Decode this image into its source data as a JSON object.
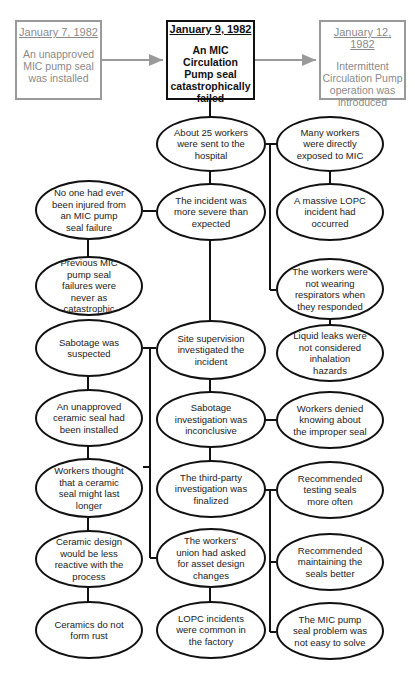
{
  "top_boxes": {
    "left": {
      "date": "January 7, 1982",
      "text": "An unapproved MIC pump seal was installed"
    },
    "center": {
      "date": "January 9, 1982",
      "text": "An MIC Circulation Pump seal catastrophically failed"
    },
    "right": {
      "date": "January 12, 1982",
      "text": "Intermittent Circulation Pump operation was introduced"
    }
  },
  "nodes": {
    "hospital": "About 25 workers were sent to the hospital",
    "exposed": "Many workers were directly exposed to MIC",
    "more_severe": "The incident was more severe than expected",
    "no_one_injured": "No one had ever been injured from an MIC pump seal failure",
    "massive_lopc": "A massive LOPC incident had occurred",
    "previous_failures": "Previous MIC pump seal failures were never as catastrophic",
    "no_respirators": "The workers were not wearing respirators when they responded",
    "sabotage_suspected": "Sabotage was suspected",
    "site_supervision": "Site supervision investigated the incident",
    "liquid_leaks": "Liquid leaks were not considered inhalation hazards",
    "ceramic_installed": "An unapproved ceramic seal had been installed",
    "sabotage_inconclusive": "Sabotage investigation was inconclusive",
    "workers_denied": "Workers denied knowing about the improper seal",
    "ceramic_longer": "Workers thought that a ceramic seal might last longer",
    "third_party": "The third-party investigation was finalized",
    "testing_seals": "Recommended testing seals more often",
    "ceramic_reactive": "Ceramic design would be less reactive with the process",
    "union_asked": "The workers' union had asked for asset design changes",
    "maintaining_seals": "Recommended maintaining the seals better",
    "no_rust": "Ceramics do not form rust",
    "lopc_common": "LOPC incidents were common in the factory",
    "not_easy": "The MIC pump seal problem was not easy to solve"
  },
  "colors": {
    "main_stroke": "#111111",
    "faded_stroke": "#9a9a9a",
    "faded_text": "#8a8a8a"
  }
}
